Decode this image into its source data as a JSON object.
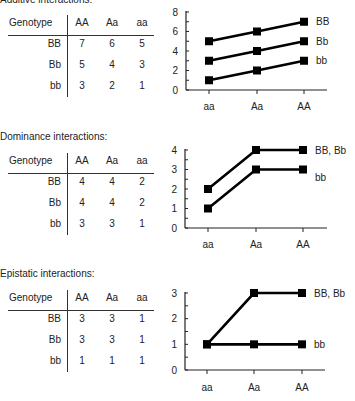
{
  "sections": [
    {
      "title": "Additive interactions:",
      "table": {
        "corner": "Genotype",
        "columns": [
          "AA",
          "Aa",
          "aa"
        ],
        "rows": [
          {
            "label": "BB",
            "values": [
              "7",
              "6",
              "5"
            ]
          },
          {
            "label": "Bb",
            "values": [
              "5",
              "4",
              "3"
            ]
          },
          {
            "label": "bb",
            "values": [
              "3",
              "2",
              "1"
            ]
          }
        ]
      }
    },
    {
      "title": "Dominance interactions:",
      "table": {
        "corner": "Genotype",
        "columns": [
          "AA",
          "Aa",
          "aa"
        ],
        "rows": [
          {
            "label": "BB",
            "values": [
              "4",
              "4",
              "2"
            ]
          },
          {
            "label": "Bb",
            "values": [
              "4",
              "4",
              "2"
            ]
          },
          {
            "label": "bb",
            "values": [
              "3",
              "3",
              "1"
            ]
          }
        ]
      }
    },
    {
      "title": "Epistatic interactions:",
      "table": {
        "corner": "Genotype",
        "columns": [
          "AA",
          "Aa",
          "aa"
        ],
        "rows": [
          {
            "label": "BB",
            "values": [
              "3",
              "3",
              "1"
            ]
          },
          {
            "label": "Bb",
            "values": [
              "3",
              "3",
              "1"
            ]
          },
          {
            "label": "bb",
            "values": [
              "1",
              "1",
              "1"
            ]
          }
        ]
      }
    }
  ],
  "chart_data": [
    {
      "type": "line",
      "title": "Additive interactions",
      "x": [
        "aa",
        "Aa",
        "AA"
      ],
      "series": [
        {
          "name": "BB",
          "values": [
            5,
            6,
            7
          ]
        },
        {
          "name": "Bb",
          "values": [
            3,
            4,
            5
          ]
        },
        {
          "name": "bb",
          "values": [
            1,
            2,
            3
          ]
        }
      ],
      "yticks": [
        "0",
        "2",
        "4",
        "6",
        "8"
      ],
      "ylim": [
        0,
        8
      ],
      "xlabel": "",
      "ylabel": "",
      "grid": false,
      "legend": "inline-right",
      "marker": "square"
    },
    {
      "type": "line",
      "title": "Dominance interactions",
      "x": [
        "aa",
        "Aa",
        "AA"
      ],
      "series": [
        {
          "name": "BB, Bb",
          "values": [
            2,
            4,
            4
          ]
        },
        {
          "name": "bb",
          "values": [
            1,
            3,
            3
          ]
        }
      ],
      "yticks": [
        "0",
        "1",
        "2",
        "3",
        "4"
      ],
      "ylim": [
        0,
        4
      ],
      "xlabel": "",
      "ylabel": "",
      "grid": false,
      "legend": "inline-right",
      "marker": "square"
    },
    {
      "type": "line",
      "title": "Epistatic interactions",
      "x": [
        "aa",
        "Aa",
        "AA"
      ],
      "series": [
        {
          "name": "BB, Bb",
          "values": [
            1,
            3,
            3
          ]
        },
        {
          "name": "bb",
          "values": [
            1,
            1,
            1
          ]
        }
      ],
      "yticks": [
        "0",
        "1",
        "2",
        "3"
      ],
      "ylim": [
        0,
        3
      ],
      "xlabel": "",
      "ylabel": "",
      "grid": false,
      "legend": "inline-right",
      "marker": "square"
    }
  ]
}
